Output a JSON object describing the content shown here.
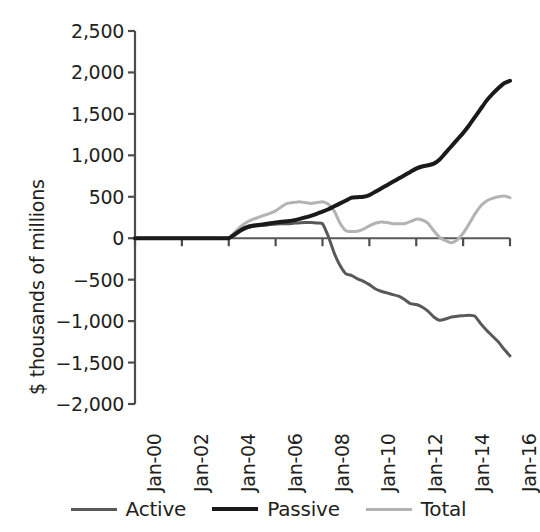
{
  "chart_data": {
    "type": "line",
    "title": "",
    "xlabel": "",
    "ylabel": "$ thousands of millions",
    "ylim": [
      -2000,
      2500
    ],
    "xlim": [
      "Jan-00",
      "Jan-16"
    ],
    "grid": false,
    "legend_position": "bottom",
    "y_ticks": [
      "2,500",
      "2,000",
      "1,500",
      "1,000",
      "500",
      "0",
      "−500",
      "−1,000",
      "−1,500",
      "−2,000"
    ],
    "y_tick_values": [
      2500,
      2000,
      1500,
      1000,
      500,
      0,
      -500,
      -1000,
      -1500,
      -2000
    ],
    "x_ticks": [
      "Jan-00",
      "Jan-02",
      "Jan-04",
      "Jan-06",
      "Jan-08",
      "Jan-10",
      "Jan-12",
      "Jan-14",
      "Jan-16"
    ],
    "x_tick_values": [
      2000,
      2002,
      2004,
      2006,
      2008,
      2010,
      2012,
      2014,
      2016
    ],
    "x": [
      2000,
      2000.5,
      2001,
      2001.5,
      2002,
      2002.5,
      2003,
      2003.5,
      2004,
      2004.25,
      2004.5,
      2004.75,
      2005,
      2005.25,
      2005.5,
      2005.75,
      2006,
      2006.25,
      2006.5,
      2006.75,
      2007,
      2007.25,
      2007.5,
      2007.75,
      2008,
      2008.25,
      2008.5,
      2008.75,
      2009,
      2009.25,
      2009.5,
      2009.75,
      2010,
      2010.25,
      2010.5,
      2010.75,
      2011,
      2011.25,
      2011.5,
      2011.75,
      2012,
      2012.25,
      2012.5,
      2012.75,
      2013,
      2013.25,
      2013.5,
      2013.75,
      2014,
      2014.25,
      2014.5,
      2014.75,
      2015,
      2015.25,
      2015.5,
      2015.75,
      2016
    ],
    "series": [
      {
        "name": "Active",
        "color": "#595959",
        "width": 3.0,
        "values": [
          0,
          0,
          0,
          0,
          0,
          0,
          0,
          0,
          0,
          40,
          85,
          120,
          140,
          150,
          155,
          165,
          170,
          175,
          175,
          180,
          185,
          190,
          190,
          185,
          175,
          20,
          -180,
          -330,
          -430,
          -450,
          -490,
          -520,
          -560,
          -610,
          -640,
          -660,
          -680,
          -700,
          -740,
          -790,
          -800,
          -830,
          -880,
          -950,
          -990,
          -975,
          -950,
          -940,
          -935,
          -930,
          -940,
          -1030,
          -1110,
          -1180,
          -1250,
          -1340,
          -1420
        ]
      },
      {
        "name": "Passive",
        "color": "#1a1a1a",
        "width": 4.0,
        "values": [
          0,
          0,
          0,
          0,
          0,
          0,
          0,
          0,
          0,
          45,
          95,
          130,
          150,
          160,
          168,
          180,
          190,
          200,
          205,
          215,
          230,
          250,
          270,
          295,
          320,
          350,
          385,
          420,
          455,
          490,
          495,
          500,
          520,
          560,
          600,
          640,
          680,
          720,
          760,
          800,
          840,
          865,
          880,
          900,
          950,
          1030,
          1110,
          1190,
          1270,
          1360,
          1460,
          1560,
          1660,
          1740,
          1810,
          1870,
          1900
        ]
      },
      {
        "name": "Total",
        "color": "#b3b3b3",
        "width": 3.0,
        "values": [
          0,
          0,
          0,
          0,
          0,
          0,
          0,
          0,
          0,
          70,
          140,
          190,
          225,
          250,
          275,
          300,
          330,
          380,
          420,
          430,
          440,
          430,
          420,
          430,
          440,
          410,
          330,
          180,
          90,
          80,
          85,
          110,
          150,
          180,
          195,
          190,
          175,
          175,
          175,
          200,
          230,
          220,
          180,
          90,
          10,
          -30,
          -55,
          -20,
          60,
          170,
          290,
          390,
          450,
          480,
          500,
          510,
          490
        ]
      }
    ]
  },
  "legend": {
    "items": [
      {
        "label": "Active",
        "color": "#595959",
        "width": 3.0
      },
      {
        "label": "Passive",
        "color": "#1a1a1a",
        "width": 4.0
      },
      {
        "label": "Total",
        "color": "#b3b3b3",
        "width": 3.0
      }
    ]
  },
  "axes": {
    "spine_color": "#4d4d4d",
    "zero_line_color": "#595959"
  }
}
